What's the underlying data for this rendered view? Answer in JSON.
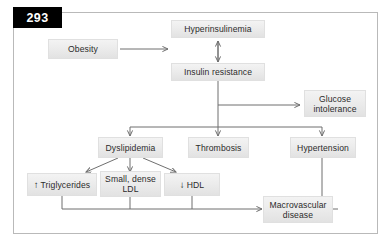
{
  "figure": {
    "number": "293"
  },
  "nodes": {
    "obesity": {
      "label": "Obesity"
    },
    "hyperinsulinemia": {
      "label": "Hyperinsulinemia"
    },
    "insulin_resistance": {
      "label": "Insulin resistance"
    },
    "glucose_intolerance": {
      "line1": "Glucose",
      "line2": "intolerance"
    },
    "dyslipidemia": {
      "label": "Dyslipidemia"
    },
    "thrombosis": {
      "label": "Thrombosis"
    },
    "hypertension": {
      "label": "Hypertension"
    },
    "triglycerides": {
      "glyph": "↑",
      "label": "Triglycerides"
    },
    "small_dense_ldl": {
      "line1": "Small, dense",
      "line2": "LDL"
    },
    "hdl": {
      "glyph": "↓",
      "label": "HDL"
    },
    "macrovascular": {
      "line1": "Macrovascular",
      "line2": "disease"
    }
  },
  "colors": {
    "node_fill_top": "#f3f3f3",
    "node_fill_bottom": "#e2e2e2",
    "connector": "#6f6f6f",
    "frame_border": "#b9b9b9",
    "badge_background": "#000000",
    "badge_text": "#ffffff",
    "page_background": "#ffffff"
  }
}
